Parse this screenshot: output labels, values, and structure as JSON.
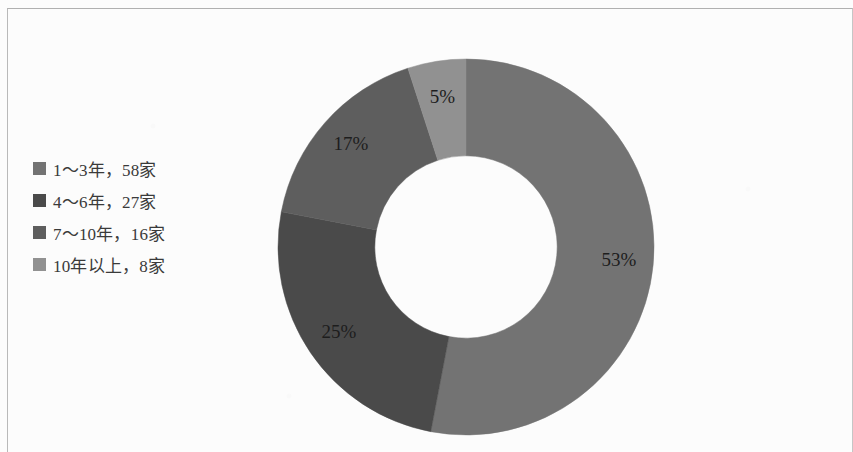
{
  "page": {
    "background_color": "#fcfcfc",
    "border_color": "#b9b9b9"
  },
  "legend": {
    "items": [
      {
        "label": "1～3年，58家",
        "color": "#737373"
      },
      {
        "label": "4～6年，27家",
        "color": "#4a4a4a"
      },
      {
        "label": "7～10年，16家",
        "color": "#5e5e5e"
      },
      {
        "label": "10年以上，8家",
        "color": "#919191"
      }
    ]
  },
  "chart_data": {
    "type": "pie",
    "variant": "donut",
    "title": "",
    "subtitle": "",
    "xlabel": "",
    "ylabel": "",
    "categories": [
      "1～3年",
      "4～6年",
      "7～10年",
      "10年以上"
    ],
    "values": [
      58,
      27,
      16,
      8
    ],
    "value_unit": "家",
    "percentages": [
      53,
      25,
      17,
      5
    ],
    "data_labels": [
      "53%",
      "25%",
      "17%",
      "5%"
    ],
    "colors": [
      "#737373",
      "#4a4a4a",
      "#5e5e5e",
      "#919191"
    ],
    "legend_entries": [
      "1～3年，58家",
      "4～6年，27家",
      "7～10年，16家",
      "10年以上，8家"
    ],
    "legend_position": "left",
    "start_angle_deg": 0,
    "direction": "clockwise",
    "inner_radius_ratio": 0.485,
    "grid": false,
    "total": 109
  }
}
